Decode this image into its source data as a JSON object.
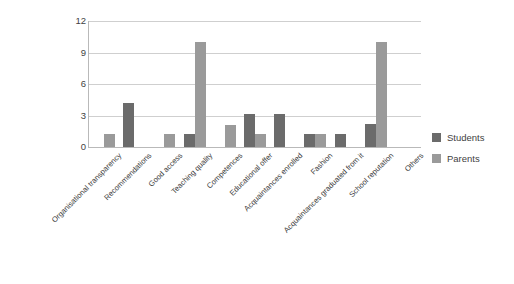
{
  "chart_data": {
    "type": "bar",
    "title": "",
    "xlabel": "",
    "ylabel": "",
    "ylim": [
      0,
      12
    ],
    "yticks": [
      0,
      3,
      6,
      9,
      12
    ],
    "grid": true,
    "legend_position": "right",
    "categories": [
      "Organisational transparency",
      "Recommendations",
      "Good access",
      "Teaching quality",
      "Competences",
      "Educational offer",
      "Acquaintances enrolled",
      "Fashion",
      "Acquaintances graduated from it",
      "School reputation",
      "Others"
    ],
    "series": [
      {
        "name": "Students",
        "color": "#6b6b6b",
        "values": [
          0,
          4.2,
          0,
          1.2,
          0,
          3.1,
          3.1,
          1.2,
          1.2,
          2.2,
          0
        ]
      },
      {
        "name": "Parents",
        "color": "#9a9a9a",
        "values": [
          1.2,
          0,
          1.2,
          10,
          2.1,
          1.2,
          0,
          1.2,
          0,
          10,
          0
        ]
      }
    ]
  },
  "legend": {
    "items": [
      {
        "label": "Students",
        "color": "#6b6b6b"
      },
      {
        "label": "Parents",
        "color": "#9a9a9a"
      }
    ]
  }
}
